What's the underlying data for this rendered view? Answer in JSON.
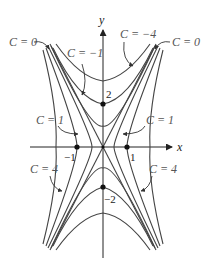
{
  "diagram": {
    "title": "",
    "function": "x^2 - y^2/4 = C",
    "axes": {
      "x_label": "x",
      "y_label": "y"
    },
    "tick_labels": {
      "x_neg1": "−1",
      "x_pos1": "1",
      "y_pos2": "2",
      "y_neg2": "−2"
    },
    "level_curve_labels": [
      {
        "id": "c0-top-left",
        "text": "C = 0"
      },
      {
        "id": "cneg1",
        "text": "C = −1"
      },
      {
        "id": "cneg4",
        "text": "C = −4"
      },
      {
        "id": "c0-top-right",
        "text": "C = 0"
      },
      {
        "id": "c1-left",
        "text": "C = 1"
      },
      {
        "id": "c1-right",
        "text": "C = 1"
      },
      {
        "id": "c4-left",
        "text": "C = 4"
      },
      {
        "id": "c4-right",
        "text": "C = 4"
      }
    ],
    "points": [
      {
        "label": "(0, 2)"
      },
      {
        "label": "(0, −2)"
      },
      {
        "label": "(1, 0)"
      },
      {
        "label": "(−1, 0)"
      },
      {
        "label": "(0, 0)"
      }
    ]
  }
}
